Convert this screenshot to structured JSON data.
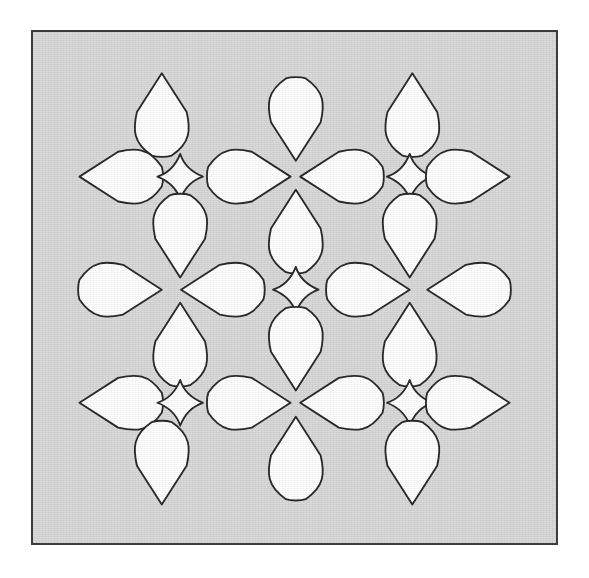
{
  "artwork": {
    "title": "Tessellated teardrop and diamond lattice",
    "description": "Light gray square panel with a thin dark border containing a repeating ornamental lattice of white teardrop (petal) shapes and small rounded diamonds arranged in four-fold rosettes.",
    "panel": {
      "background_color": "#d9d9d9",
      "border_color": "#3c3c3c",
      "border_width_px": 2,
      "x": 31,
      "y": 30,
      "width": 527,
      "height": 515
    },
    "page_background_color": "#ffffff",
    "shape_fill_color": "#fefefe",
    "shape_stroke_color": "#2b2b2b",
    "shape_stroke_width_px": 2.1,
    "counts": {
      "teardrops": 24,
      "diamonds": 5,
      "total_shapes": 29
    },
    "grid": {
      "columns": 6,
      "rows": 7,
      "rosette_repeats": 4
    }
  },
  "shapes": [
    {
      "id": "teardrop-r1-c2-up",
      "type": "teardrop",
      "direction": "up",
      "cx": 147,
      "cy": 94,
      "rx": 33,
      "ry": 47
    },
    {
      "id": "teardrop-r1-c3-down",
      "type": "teardrop",
      "direction": "down",
      "cx": 300,
      "cy": 100,
      "rx": 33,
      "ry": 47
    },
    {
      "id": "teardrop-r1-c5-up",
      "type": "teardrop",
      "direction": "up",
      "cx": 433,
      "cy": 94,
      "rx": 33,
      "ry": 47
    },
    {
      "id": "teardrop-r2-c1-left",
      "type": "teardrop",
      "direction": "left",
      "cx": 100,
      "cy": 165,
      "rx": 47,
      "ry": 33
    },
    {
      "id": "diamond-r2-c2",
      "type": "diamond",
      "direction": "none",
      "cx": 168,
      "cy": 165,
      "rx": 26,
      "ry": 26
    },
    {
      "id": "teardrop-r2-c3-right",
      "type": "teardrop",
      "direction": "right",
      "cx": 247,
      "cy": 165,
      "rx": 47,
      "ry": 33
    },
    {
      "id": "teardrop-r2-c4-left",
      "type": "teardrop",
      "direction": "left",
      "cx": 352,
      "cy": 165,
      "rx": 47,
      "ry": 33
    },
    {
      "id": "diamond-r2-c5",
      "type": "diamond",
      "direction": "none",
      "cx": 430,
      "cy": 165,
      "rx": 26,
      "ry": 26
    },
    {
      "id": "teardrop-r2-c6-right",
      "type": "teardrop",
      "direction": "right",
      "cx": 497,
      "cy": 165,
      "rx": 47,
      "ry": 33
    },
    {
      "id": "teardrop-r3-c2-down",
      "type": "teardrop",
      "direction": "down",
      "cx": 168,
      "cy": 233,
      "rx": 33,
      "ry": 47
    },
    {
      "id": "teardrop-r3-c3-up",
      "type": "teardrop",
      "direction": "up",
      "cx": 300,
      "cy": 227,
      "rx": 33,
      "ry": 47
    },
    {
      "id": "teardrop-r3-c5-down",
      "type": "teardrop",
      "direction": "down",
      "cx": 430,
      "cy": 233,
      "rx": 33,
      "ry": 47
    },
    {
      "id": "teardrop-r4-c1-right",
      "type": "teardrop",
      "direction": "right",
      "cx": 100,
      "cy": 294,
      "rx": 47,
      "ry": 33
    },
    {
      "id": "teardrop-r4-c2-left",
      "type": "teardrop",
      "direction": "left",
      "cx": 216,
      "cy": 294,
      "rx": 47,
      "ry": 33
    },
    {
      "id": "diamond-center",
      "type": "diamond",
      "direction": "none",
      "cx": 300,
      "cy": 294,
      "rx": 26,
      "ry": 26
    },
    {
      "id": "teardrop-r4-c4-right",
      "type": "teardrop",
      "direction": "right",
      "cx": 383,
      "cy": 294,
      "rx": 47,
      "ry": 33
    },
    {
      "id": "teardrop-r4-c5-left",
      "type": "teardrop",
      "direction": "left",
      "cx": 497,
      "cy": 294,
      "rx": 47,
      "ry": 33
    },
    {
      "id": "teardrop-r5-c2-up",
      "type": "teardrop",
      "direction": "up",
      "cx": 168,
      "cy": 356,
      "rx": 33,
      "ry": 47
    },
    {
      "id": "teardrop-r5-c3-down",
      "type": "teardrop",
      "direction": "down",
      "cx": 300,
      "cy": 362,
      "rx": 33,
      "ry": 47
    },
    {
      "id": "teardrop-r5-c5-up",
      "type": "teardrop",
      "direction": "up",
      "cx": 430,
      "cy": 356,
      "rx": 33,
      "ry": 47
    },
    {
      "id": "teardrop-r6-c1-left",
      "type": "teardrop",
      "direction": "left",
      "cx": 100,
      "cy": 423,
      "rx": 47,
      "ry": 33
    },
    {
      "id": "diamond-r6-c2",
      "type": "diamond",
      "direction": "none",
      "cx": 168,
      "cy": 423,
      "rx": 26,
      "ry": 26
    },
    {
      "id": "teardrop-r6-c3-right",
      "type": "teardrop",
      "direction": "right",
      "cx": 247,
      "cy": 423,
      "rx": 47,
      "ry": 33
    },
    {
      "id": "teardrop-r6-c4-left",
      "type": "teardrop",
      "direction": "left",
      "cx": 352,
      "cy": 423,
      "rx": 47,
      "ry": 33
    },
    {
      "id": "diamond-r6-c5",
      "type": "diamond",
      "direction": "none",
      "cx": 430,
      "cy": 423,
      "rx": 26,
      "ry": 26
    },
    {
      "id": "teardrop-r6-c6-right",
      "type": "teardrop",
      "direction": "right",
      "cx": 497,
      "cy": 423,
      "rx": 47,
      "ry": 33
    },
    {
      "id": "teardrop-r7-c2-down",
      "type": "teardrop",
      "direction": "down",
      "cx": 147,
      "cy": 492,
      "rx": 33,
      "ry": 47
    },
    {
      "id": "teardrop-r7-c3-up",
      "type": "teardrop",
      "direction": "up",
      "cx": 300,
      "cy": 486,
      "rx": 33,
      "ry": 47
    },
    {
      "id": "teardrop-r7-c5-down",
      "type": "teardrop",
      "direction": "down",
      "cx": 433,
      "cy": 492,
      "rx": 33,
      "ry": 47
    }
  ]
}
